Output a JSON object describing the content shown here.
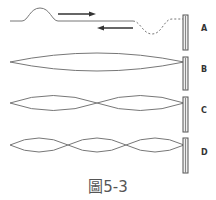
{
  "diagram": {
    "caption": "圖5-3",
    "panels": [
      {
        "id": "A",
        "label": "A",
        "description": "pulse travelling right, reflected pulse travelling left (dashed)"
      },
      {
        "id": "B",
        "label": "B",
        "description": "standing wave, 1 loop"
      },
      {
        "id": "C",
        "label": "C",
        "description": "standing wave, 2 loops"
      },
      {
        "id": "D",
        "label": "D",
        "description": "standing wave, 3 loops"
      }
    ],
    "arrows": [
      {
        "direction": "right"
      },
      {
        "direction": "left"
      }
    ],
    "colors": {
      "line": "#777777",
      "arrow": "#333333",
      "pole": "#555555"
    }
  }
}
